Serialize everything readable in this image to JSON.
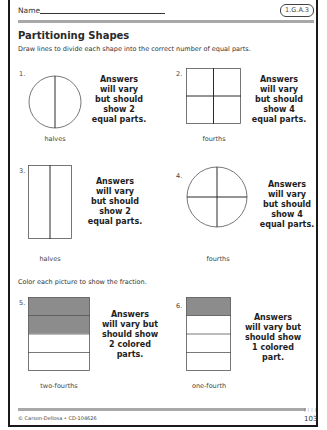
{
  "header": {
    "name_label": "Name",
    "standard_code": "1.G.A.3"
  },
  "section1": {
    "title": "Partitioning Shapes",
    "instructions": "Draw lines to divide each shape into the correct number of equal parts."
  },
  "problems": [
    {
      "number": "1.",
      "shape": "circle",
      "caption": "halves",
      "answer": [
        "Answers",
        "will vary",
        "but should",
        "show 2",
        "equal parts."
      ]
    },
    {
      "number": "2.",
      "shape": "square",
      "caption": "fourths",
      "answer": [
        "Answers",
        "will vary",
        "but should",
        "show 4",
        "equal parts."
      ]
    },
    {
      "number": "3.",
      "shape": "rectangle",
      "caption": "halves",
      "answer": [
        "Answers",
        "will vary",
        "but should",
        "show 2",
        "equal parts."
      ]
    },
    {
      "number": "4.",
      "shape": "circle",
      "caption": "fourths",
      "answer": [
        "Answers",
        "will vary",
        "but should",
        "show 4",
        "equal parts."
      ]
    }
  ],
  "section2": {
    "instructions": "Color each picture to show the fraction."
  },
  "coloring": [
    {
      "number": "5.",
      "caption": "two-fourths",
      "parts": 4,
      "colored": 2,
      "answer": [
        "Answers",
        "will vary but",
        "should show",
        "2 colored",
        "parts."
      ]
    },
    {
      "number": "6.",
      "caption": "one-fourth",
      "parts": 4,
      "colored": 1,
      "answer": [
        "Answers",
        "will vary but",
        "should show",
        "1 colored",
        "part."
      ]
    }
  ],
  "colors": {
    "shape_fill": "#8c8c8c",
    "stroke": "#555555",
    "divider": "#2a2a2a",
    "bar": "#a8a8a8"
  },
  "footer": {
    "copyright": "© Carson-Dellosa • CD-104626",
    "page_number": "103",
    "ticks": "| | | |"
  }
}
